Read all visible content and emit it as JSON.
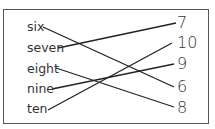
{
  "words": [
    {
      "label": "six",
      "y": 20
    },
    {
      "label": "seven",
      "y": 41
    },
    {
      "label": "eight",
      "y": 62
    },
    {
      "label": "nine",
      "y": 82
    },
    {
      "label": "ten",
      "y": 102
    }
  ],
  "numbers": [
    {
      "label": "7",
      "y": 14
    },
    {
      "label": "10",
      "y": 34
    },
    {
      "label": "9",
      "y": 55
    },
    {
      "label": "6",
      "y": 78
    },
    {
      "label": "8",
      "y": 99
    }
  ],
  "connections": [
    {
      "from": "six",
      "to": "6",
      "x1": 43,
      "y1": 27,
      "x2": 174,
      "y2": 87
    },
    {
      "from": "seven",
      "to": "7",
      "x1": 58,
      "y1": 48,
      "x2": 176,
      "y2": 23
    },
    {
      "from": "eight",
      "to": "8",
      "x1": 56,
      "y1": 68,
      "x2": 174,
      "y2": 107
    },
    {
      "from": "nine",
      "to": "9",
      "x1": 52,
      "y1": 89,
      "x2": 174,
      "y2": 64
    },
    {
      "from": "ten",
      "to": "10",
      "x1": 48,
      "y1": 110,
      "x2": 172,
      "y2": 43
    }
  ],
  "colors": {
    "line": "#222222",
    "text": "#333333",
    "border": "#555555"
  }
}
